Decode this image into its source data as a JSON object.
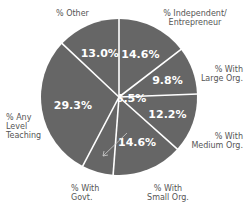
{
  "chart_data": {
    "type": "pie",
    "title": "",
    "start": "top",
    "direction": "clockwise",
    "slice_color": "#666666",
    "separator_color": "#ffffff",
    "value_label_color": "#ffffff",
    "slices": [
      {
        "label": "% Independent/ Entrepreneur",
        "value": 14.6,
        "text": "14.6%"
      },
      {
        "label": "% With Large Org.",
        "value": 9.8,
        "text": "9.8%"
      },
      {
        "label": "% With Medium Org.",
        "value": 12.2,
        "text": "12.2%"
      },
      {
        "label": "% With Small Org.",
        "value": 14.6,
        "text": "14.6%"
      },
      {
        "label": "% With Govt.",
        "value": 6.5,
        "text": "6.5%"
      },
      {
        "label": "% Any Level Teaching",
        "value": 29.3,
        "text": "29.3%"
      },
      {
        "label": "% Other",
        "value": 13.0,
        "text": "13.0%"
      }
    ]
  },
  "labels": {
    "independent_1": "% Independent/",
    "independent_2": "Entrepreneur",
    "large_1": "% With",
    "large_2": "Large Org.",
    "medium_1": "% With",
    "medium_2": "Medium Org.",
    "small_1": "% With",
    "small_2": "Small Org.",
    "govt_1": "% With",
    "govt_2": "Govt.",
    "teaching_1": "% Any",
    "teaching_2": "Level",
    "teaching_3": "Teaching",
    "other_1": "% Other"
  }
}
